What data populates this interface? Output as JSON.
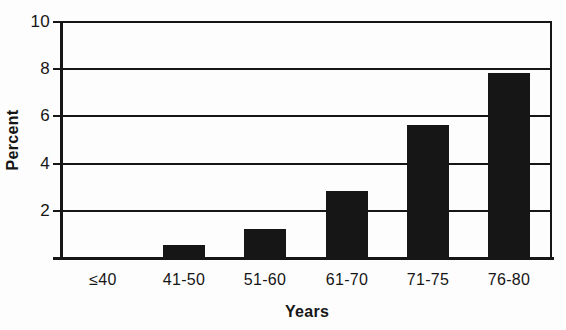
{
  "figure": {
    "background": "#fdfdfd",
    "ink": "#161616"
  },
  "chart_data": {
    "type": "bar",
    "categories": [
      "≤40",
      "41-50",
      "51-60",
      "61-70",
      "71-75",
      "76-80"
    ],
    "values": [
      0,
      0.5,
      1.2,
      2.8,
      5.6,
      7.8
    ],
    "title": "",
    "xlabel": "Years",
    "ylabel": "Percent",
    "ylim": [
      0,
      10
    ],
    "yticks": [
      2,
      4,
      6,
      8,
      10
    ],
    "ytick_labels": [
      "2",
      "4",
      "6",
      "8",
      "10"
    ],
    "grid": true,
    "legend": false,
    "bar_color": "#161616"
  }
}
